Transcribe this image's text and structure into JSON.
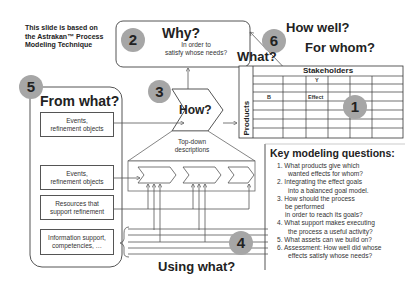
{
  "note": {
    "line1": "This slide is based on",
    "line2": "the Astrakan™ Process",
    "line3": "Modeling Technique"
  },
  "why_box": {
    "badge": "2",
    "title": "Why?",
    "sub1": "In order to",
    "sub2": "satisfy whose needs?"
  },
  "how_well": {
    "badge": "6",
    "title1": "How well?",
    "title2": "For whom?"
  },
  "what": {
    "title": "What?",
    "table_header": "Stakeholders",
    "row_label": "Products",
    "col_marker": "Y",
    "row_marker": "B",
    "cell_marker": "Effect",
    "badge": "1"
  },
  "from_what": {
    "badge": "5",
    "title": "From what?",
    "boxes": [
      {
        "line1": "Events,",
        "line2": "refinement objects"
      },
      {
        "line1": "Events,",
        "line2": "refinement objects"
      },
      {
        "line1": "Resources that",
        "line2": "support refinement"
      },
      {
        "line1": "Information support,",
        "line2": "competencies, …"
      }
    ]
  },
  "how": {
    "badge": "3",
    "title": "How?",
    "sub1": "Top-down",
    "sub2": "descriptions"
  },
  "using_what": {
    "badge": "4",
    "title": "Using what?"
  },
  "key_questions": {
    "title": "Key modeling questions:",
    "items": [
      {
        "l1": "1. What products give which",
        "l2": "wanted effects for whom?"
      },
      {
        "l1": "2. Integrating the effect goals",
        "l2": "into a balanced goal model."
      },
      {
        "l1": "3. How should the process",
        "l2": "be performed",
        "l3": "in order to reach its goals?"
      },
      {
        "l1": "4. What support makes executing",
        "l2": "the process a useful activity?"
      },
      {
        "l1": "5. What assets can we build on?"
      },
      {
        "l1": "6. Assessment: How well did whose",
        "l2": "effects satisfy whose needs?"
      }
    ]
  },
  "colors": {
    "badge": "#a6a6a6",
    "line": "#555555",
    "text": "#222222"
  }
}
